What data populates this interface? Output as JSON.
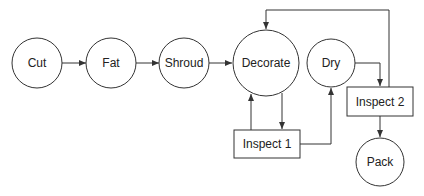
{
  "diagram": {
    "type": "process-flow",
    "nodes": [
      {
        "id": "cut",
        "label": "Cut",
        "shape": "circle"
      },
      {
        "id": "fat",
        "label": "Fat",
        "shape": "circle"
      },
      {
        "id": "shroud",
        "label": "Shroud",
        "shape": "circle"
      },
      {
        "id": "decorate",
        "label": "Decorate",
        "shape": "circle"
      },
      {
        "id": "dry",
        "label": "Dry",
        "shape": "circle"
      },
      {
        "id": "inspect1",
        "label": "Inspect 1",
        "shape": "rectangle"
      },
      {
        "id": "inspect2",
        "label": "Inspect 2",
        "shape": "rectangle"
      },
      {
        "id": "pack",
        "label": "Pack",
        "shape": "circle"
      }
    ],
    "edges": [
      {
        "from": "cut",
        "to": "fat"
      },
      {
        "from": "fat",
        "to": "shroud"
      },
      {
        "from": "shroud",
        "to": "decorate"
      },
      {
        "from": "decorate",
        "to": "inspect1"
      },
      {
        "from": "inspect1",
        "to": "decorate"
      },
      {
        "from": "inspect1",
        "to": "dry"
      },
      {
        "from": "dry",
        "to": "inspect2"
      },
      {
        "from": "inspect2",
        "to": "decorate"
      },
      {
        "from": "inspect2",
        "to": "pack"
      }
    ],
    "colors": {
      "stroke": "#333333",
      "fill": "#ffffff",
      "text": "#222222"
    }
  }
}
